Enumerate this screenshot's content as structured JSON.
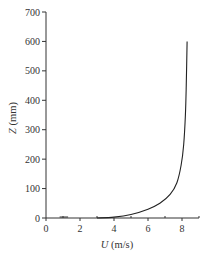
{
  "chart_data": {
    "type": "line",
    "title": "",
    "xlabel": "U (m/s)",
    "xlabel_var": "U",
    "xlabel_unit": " (m/s)",
    "ylabel": "Z (mm)",
    "ylabel_var": "Z",
    "ylabel_unit": " (mm)",
    "xlim": [
      0,
      9
    ],
    "ylim": [
      0,
      700
    ],
    "x_ticks": [
      0,
      2,
      4,
      6,
      8
    ],
    "x_minor_ticks": [
      1,
      3,
      5,
      7,
      9
    ],
    "y_ticks": [
      0,
      100,
      200,
      300,
      400,
      500,
      600,
      700
    ],
    "grid": false,
    "legend": null,
    "series": [
      {
        "name": "velocity profile",
        "color": "#222222",
        "x": [
          3.0,
          4.0,
          5.0,
          6.0,
          6.7,
          7.3,
          7.7,
          7.95,
          8.1,
          8.2,
          8.25,
          8.3
        ],
        "y": [
          0,
          3,
          12,
          30,
          50,
          80,
          120,
          180,
          250,
          350,
          450,
          600
        ]
      }
    ]
  },
  "labels": {
    "x_ticks": [
      "0",
      "2",
      "4",
      "6",
      "8"
    ],
    "y_ticks": [
      "0",
      "100",
      "200",
      "300",
      "400",
      "500",
      "600",
      "700"
    ]
  }
}
